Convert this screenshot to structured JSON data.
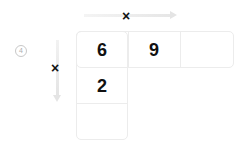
{
  "step_number": "4",
  "top_operator": "×",
  "left_operator": "×",
  "top_row": [
    "6",
    "9",
    ""
  ],
  "left_column": [
    "6",
    "2",
    ""
  ],
  "cells": {
    "r0c0": "6",
    "r0c1": "9",
    "r0c2": "",
    "r1c0": "2",
    "r2c0": ""
  },
  "colors": {
    "arrow": "#e4e4e4",
    "text": "#111111",
    "grid_line": "#ececec"
  }
}
